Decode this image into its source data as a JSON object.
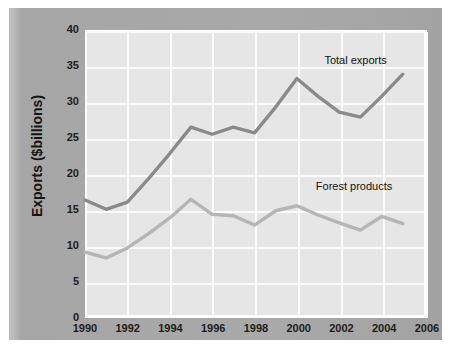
{
  "chart_data": {
    "type": "line",
    "title": "",
    "xlabel": "",
    "ylabel": "Exports ($billions)",
    "xlim": [
      1990,
      2006
    ],
    "ylim": [
      0,
      40
    ],
    "xticks": [
      1990,
      1992,
      1994,
      1996,
      1998,
      2000,
      2002,
      2004,
      2006
    ],
    "yticks": [
      0,
      5,
      10,
      15,
      20,
      25,
      30,
      35,
      40
    ],
    "grid": true,
    "legend_position": "inline-annotation",
    "x": [
      1990,
      1991,
      1992,
      1993,
      1994,
      1995,
      1996,
      1997,
      1998,
      1999,
      2000,
      2001,
      2002,
      2003,
      2004,
      2005
    ],
    "series": [
      {
        "name": "Total exports",
        "color": "#8a8a8a",
        "values": [
          16.5,
          15.2,
          16.2,
          19.5,
          23.0,
          26.7,
          25.7,
          26.7,
          25.9,
          29.5,
          33.5,
          31.0,
          28.8,
          28.1,
          31.0,
          34.1
        ]
      },
      {
        "name": "Forest products",
        "color": "#b5b5b5",
        "values": [
          9.2,
          8.4,
          9.8,
          11.8,
          14.0,
          16.6,
          14.5,
          14.3,
          13.0,
          15.0,
          15.7,
          14.4,
          13.3,
          12.3,
          14.2,
          13.2
        ]
      }
    ],
    "annotations": [
      {
        "text": "Total exports",
        "x": 2001.2,
        "y": 36.0
      },
      {
        "text": "Forest products",
        "x": 2000.8,
        "y": 18.5
      }
    ]
  },
  "axes": {
    "y_title": "Exports ($billions)",
    "y_tick_labels": [
      "40",
      "35",
      "30",
      "25",
      "20",
      "15",
      "10",
      "5",
      "0"
    ],
    "x_tick_labels": [
      "1990",
      "1992",
      "1994",
      "1996",
      "1998",
      "2000",
      "2002",
      "2004",
      "2006"
    ]
  },
  "labels": {
    "total_exports": "Total exports",
    "forest_products": "Forest products"
  },
  "colors": {
    "panel_background": "#a9a9a9",
    "plot_background": "#e6e6e6",
    "gridline": "#fbfbfb",
    "total_exports_line": "#8a8a8a",
    "forest_products_line": "#b5b5b5",
    "text": "#1c1c1c"
  }
}
